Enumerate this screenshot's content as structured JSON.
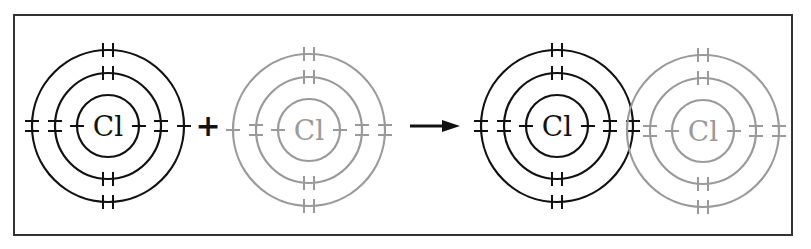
{
  "diagram": {
    "frame": {
      "x": 14,
      "y": 15,
      "width": 778,
      "height": 220,
      "color": "#333333"
    },
    "colors": {
      "dark": "#111111",
      "light": "#9a9a9a"
    },
    "shell_radii": [
      31,
      53,
      76
    ],
    "atoms": [
      {
        "id": "reactant-atom-1",
        "symbol": "Cl",
        "cx": 108,
        "cy": 126,
        "tone": "dark",
        "electrons": {
          "top": [
            0,
            2,
            2
          ],
          "bottom": [
            0,
            2,
            2
          ],
          "left": [
            1,
            2,
            2
          ],
          "right": [
            1,
            2,
            1
          ]
        }
      },
      {
        "id": "reactant-atom-2",
        "symbol": "Cl",
        "cx": 309,
        "cy": 130,
        "tone": "light",
        "electrons": {
          "top": [
            0,
            2,
            2
          ],
          "bottom": [
            0,
            2,
            2
          ],
          "left": [
            1,
            2,
            1
          ],
          "right": [
            1,
            2,
            2
          ]
        }
      },
      {
        "id": "product-atom-1",
        "symbol": "Cl",
        "cx": 557,
        "cy": 126,
        "tone": "dark",
        "electrons": {
          "top": [
            0,
            2,
            2
          ],
          "bottom": [
            0,
            2,
            2
          ],
          "left": [
            1,
            2,
            2
          ],
          "right": [
            1,
            2,
            2
          ]
        }
      },
      {
        "id": "product-atom-2",
        "symbol": "Cl",
        "cx": 703,
        "cy": 131,
        "tone": "light",
        "electrons": {
          "top": [
            0,
            2,
            2
          ],
          "bottom": [
            0,
            2,
            2
          ],
          "left": [
            1,
            2,
            0
          ],
          "right": [
            1,
            2,
            2
          ]
        }
      }
    ],
    "plus": {
      "symbol": "+",
      "x": 208,
      "y": 126
    },
    "arrow": {
      "x1": 410,
      "x2": 460,
      "y": 126
    },
    "shared_pair_note": "Shared electron pair at overlap of outer shells"
  }
}
